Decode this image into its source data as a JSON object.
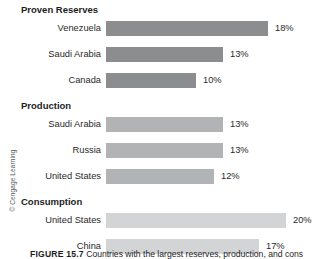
{
  "figure": {
    "credit": "© Cengage Learning",
    "caption_label": "FIGURE 15.7",
    "caption_text": "Countries with the largest reserves, production, and cons"
  },
  "chart_data": {
    "type": "bar",
    "title": "",
    "xlabel": "",
    "ylabel": "",
    "orientation": "horizontal",
    "grid": false,
    "legend": "none",
    "xlim": [
      0,
      22
    ],
    "value_suffix": "%",
    "groups": [
      {
        "name": "Proven Reserves",
        "color": "#8c8d8f",
        "categories": [
          "Venezuela",
          "Saudi Arabia",
          "Canada"
        ],
        "values": [
          18,
          13,
          10
        ],
        "value_labels": [
          "18%",
          "13%",
          "10%"
        ]
      },
      {
        "name": "Production",
        "color": "#b2b3b5",
        "categories": [
          "Saudi Arabia",
          "Russia",
          "United States"
        ],
        "values": [
          13,
          13,
          12
        ],
        "value_labels": [
          "13%",
          "13%",
          "12%"
        ]
      },
      {
        "name": "Consumption",
        "color": "#d3d4d6",
        "categories": [
          "United States",
          "China",
          "Japan"
        ],
        "values": [
          20,
          17,
          5
        ],
        "value_labels": [
          "20%",
          "17%",
          "5%"
        ]
      }
    ]
  }
}
